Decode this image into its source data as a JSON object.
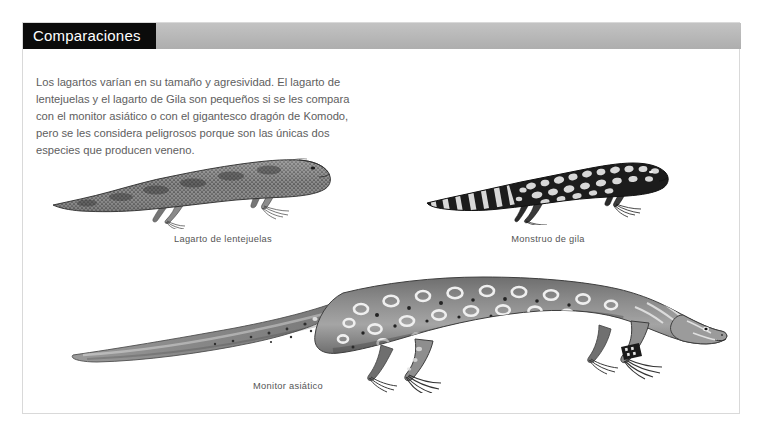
{
  "page": {
    "header": {
      "title": "Comparaciones"
    },
    "intro_paragraph": "Los lagartos varían en su tamaño y agresividad. El lagarto de lentejuelas y el lagarto de Gila son pequeños si se les compara con el monitor asiático o con el gigantesco dragón de Komodo, pero se les considera peligrosos porque son las únicas dos especies que producen veneno.",
    "figures": [
      {
        "id": "beaded-lizard",
        "caption": "Lagarto de lentejuelas",
        "illustration": "beaded-lizard-illustration"
      },
      {
        "id": "gila-monster",
        "caption": "Monstruo de gila",
        "illustration": "gila-monster-illustration"
      },
      {
        "id": "asian-monitor",
        "caption": "Monitor asiático",
        "illustration": "asian-monitor-illustration"
      }
    ],
    "colors": {
      "title_box": "#0b0b0b",
      "title_text": "#ffffff",
      "header_band": "#b9b9b9",
      "body_text": "#5e5e5e",
      "caption_text": "#555555",
      "page_background": "#ffffff",
      "page_border": "#d9d9d9"
    }
  }
}
